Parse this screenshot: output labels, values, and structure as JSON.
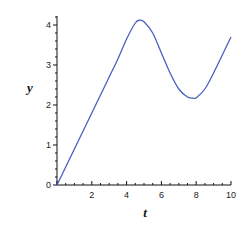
{
  "chart_data": {
    "type": "line",
    "title": "",
    "xlabel": "t",
    "ylabel": "y",
    "xlim": [
      0,
      10
    ],
    "ylim": [
      0,
      4.25
    ],
    "x_ticks": [
      0,
      2,
      4,
      6,
      8,
      10
    ],
    "x_tick_labels": [
      "0",
      "2",
      "4",
      "6",
      "8",
      "10"
    ],
    "y_ticks": [
      0,
      1,
      2,
      3,
      4
    ],
    "y_tick_labels": [
      "0",
      "1",
      "2",
      "3",
      "4"
    ],
    "grid": false,
    "legend": null,
    "series": [
      {
        "name": "y(t)",
        "color": "#4a5fc1",
        "x": [
          0,
          0.5,
          1,
          1.5,
          2,
          2.5,
          3,
          3.5,
          4,
          4.5,
          4.75,
          5,
          5.5,
          6,
          6.5,
          7,
          7.5,
          7.85,
          8,
          8.5,
          9,
          9.5,
          10
        ],
        "y": [
          0,
          0.45,
          0.9,
          1.35,
          1.8,
          2.25,
          2.7,
          3.15,
          3.65,
          4.05,
          4.12,
          4.08,
          3.8,
          3.3,
          2.8,
          2.4,
          2.2,
          2.17,
          2.18,
          2.4,
          2.8,
          3.25,
          3.7
        ]
      }
    ]
  }
}
